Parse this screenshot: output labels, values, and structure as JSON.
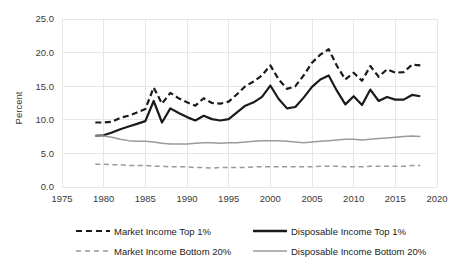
{
  "chart_data": {
    "type": "line",
    "title": "",
    "xlabel": "",
    "ylabel": "Percent",
    "xlim": [
      1975,
      2020
    ],
    "ylim": [
      0,
      25
    ],
    "ytick_labels": [
      "0.0",
      "5.0",
      "10.0",
      "15.0",
      "20.0",
      "25.0"
    ],
    "ytick_values": [
      0,
      5,
      10,
      15,
      20,
      25
    ],
    "xtick_labels": [
      "1975",
      "1980",
      "1985",
      "1990",
      "1995",
      "2000",
      "2005",
      "2010",
      "2015",
      "2020"
    ],
    "xtick_values": [
      1975,
      1980,
      1985,
      1990,
      1995,
      2000,
      2005,
      2010,
      2015,
      2020
    ],
    "grid": true,
    "legend_position": "bottom",
    "x": [
      1979,
      1980,
      1981,
      1982,
      1983,
      1984,
      1985,
      1986,
      1987,
      1988,
      1989,
      1990,
      1991,
      1992,
      1993,
      1994,
      1995,
      1996,
      1997,
      1998,
      1999,
      2000,
      2001,
      2002,
      2003,
      2004,
      2005,
      2006,
      2007,
      2008,
      2009,
      2010,
      2011,
      2012,
      2013,
      2014,
      2015,
      2016,
      2017,
      2018
    ],
    "series": [
      {
        "name": "Market Income Top 1%",
        "style": "dashed",
        "color": "#1a1a1a",
        "width": 2.2,
        "values": [
          9.6,
          9.6,
          9.7,
          10.3,
          10.6,
          11.1,
          11.6,
          14.8,
          12.4,
          14.0,
          13.2,
          12.6,
          12.1,
          13.2,
          12.5,
          12.4,
          12.7,
          13.8,
          15.0,
          15.7,
          16.6,
          18.1,
          16.0,
          14.6,
          15.0,
          16.6,
          18.5,
          19.7,
          20.5,
          18.0,
          16.0,
          17.0,
          15.8,
          18.0,
          16.4,
          17.5,
          17.0,
          17.1,
          18.2,
          18.1
        ]
      },
      {
        "name": "Disposable Income Top 1%",
        "style": "solid",
        "color": "#1a1a1a",
        "width": 2.2,
        "values": [
          7.6,
          7.7,
          8.1,
          8.6,
          9.0,
          9.4,
          9.8,
          12.8,
          9.6,
          11.7,
          11.0,
          10.4,
          9.9,
          10.6,
          10.1,
          9.9,
          10.1,
          11.1,
          12.1,
          12.6,
          13.4,
          15.1,
          13.1,
          11.7,
          11.9,
          13.3,
          14.9,
          16.0,
          16.6,
          14.3,
          12.3,
          13.5,
          12.2,
          14.5,
          12.8,
          13.4,
          13.0,
          13.0,
          13.7,
          13.5
        ]
      },
      {
        "name": "Market Income Bottom 20%",
        "style": "dashed",
        "color": "#9a9a9a",
        "width": 1.5,
        "values": [
          3.4,
          3.4,
          3.3,
          3.3,
          3.2,
          3.2,
          3.2,
          3.1,
          3.1,
          3.0,
          3.0,
          3.0,
          2.9,
          2.9,
          2.8,
          2.9,
          2.9,
          2.9,
          2.9,
          3.0,
          3.0,
          3.0,
          3.0,
          3.0,
          3.0,
          3.0,
          3.0,
          3.1,
          3.1,
          3.1,
          3.0,
          3.0,
          3.0,
          3.1,
          3.1,
          3.1,
          3.1,
          3.1,
          3.2,
          3.2
        ]
      },
      {
        "name": "Disposable Income Bottom 20%",
        "style": "solid",
        "color": "#9a9a9a",
        "width": 1.5,
        "values": [
          7.6,
          7.6,
          7.4,
          7.1,
          6.9,
          6.8,
          6.8,
          6.7,
          6.5,
          6.4,
          6.4,
          6.4,
          6.5,
          6.6,
          6.6,
          6.5,
          6.6,
          6.6,
          6.7,
          6.8,
          6.9,
          6.9,
          6.9,
          6.8,
          6.7,
          6.6,
          6.7,
          6.8,
          6.9,
          7.0,
          7.1,
          7.1,
          7.0,
          7.1,
          7.2,
          7.3,
          7.4,
          7.5,
          7.6,
          7.5
        ]
      }
    ]
  },
  "legend": {
    "items": [
      {
        "label": "Market Income Top 1%",
        "style": "dashed",
        "color": "#1a1a1a",
        "width": 2.2
      },
      {
        "label": "Disposable Income Top 1%",
        "style": "solid",
        "color": "#1a1a1a",
        "width": 2.4
      },
      {
        "label": "Market Income Bottom 20%",
        "style": "dashed",
        "color": "#9a9a9a",
        "width": 1.4
      },
      {
        "label": "Disposable Income Bottom 20%",
        "style": "solid",
        "color": "#9a9a9a",
        "width": 1.4
      }
    ]
  },
  "colors": {
    "grid": "#e6e6e6",
    "axis_text": "#3a3a3a",
    "legend_text": "#222222",
    "background": "#ffffff"
  }
}
